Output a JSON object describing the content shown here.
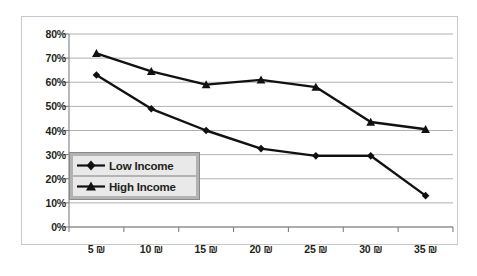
{
  "chart_data": {
    "type": "line",
    "title": "",
    "xlabel": "",
    "ylabel": "",
    "x": [
      "5 ₪",
      "10 ₪",
      "15 ₪",
      "20 ₪",
      "25 ₪",
      "30 ₪",
      "35 ₪"
    ],
    "categories": [
      "5 ₪",
      "10 ₪",
      "15 ₪",
      "20 ₪",
      "25 ₪",
      "30 ₪",
      "35 ₪"
    ],
    "series": [
      {
        "name": "Low Income",
        "marker": "diamond",
        "color": "#111111",
        "values": [
          63,
          49,
          40,
          32.5,
          29.5,
          29.5,
          13
        ]
      },
      {
        "name": "High Income",
        "marker": "triangle",
        "color": "#111111",
        "values": [
          72,
          64.5,
          59,
          61,
          58,
          43.5,
          40.5
        ]
      }
    ],
    "ylim": [
      0,
      80
    ],
    "y_ticks": [
      0,
      10,
      20,
      30,
      40,
      50,
      60,
      70,
      80
    ],
    "y_tick_labels": [
      "0%",
      "10%",
      "20%",
      "30%",
      "40%",
      "50%",
      "60%",
      "70%",
      "80%"
    ],
    "grid": true,
    "grid_axis": "y",
    "legend_position": "inside-lower-left",
    "value_format": "percent"
  },
  "legend": {
    "items": [
      {
        "label": "Low Income",
        "marker": "diamond"
      },
      {
        "label": "High Income",
        "marker": "triangle"
      }
    ]
  },
  "colors": {
    "series_line": "#111111",
    "gridline": "#a8a8a8",
    "axis": "#808080",
    "frame": "#c9c9c9",
    "legend_background": "#b3b3b3",
    "legend_row_background": "#e9e9e9",
    "text": "#231f20",
    "plot_background": "#ffffff"
  }
}
